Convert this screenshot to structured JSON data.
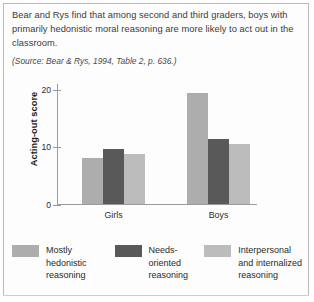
{
  "caption": {
    "text": "Bear and Rys find that among second and third graders, boys with primarily hedonistic moral reasoning are more likely to act out in the classroom.",
    "source": "(Source: Bear & Rys, 1994, Table 2, p. 636.)"
  },
  "chart_data": {
    "type": "bar",
    "title": "",
    "xlabel": "",
    "ylabel": "Acting-out score",
    "categories": [
      "Girls",
      "Boys"
    ],
    "ylim": [
      0,
      21
    ],
    "yticks": [
      0,
      10,
      20
    ],
    "ytick_labels": [
      "0",
      "10",
      "20"
    ],
    "grid": false,
    "legend_position": "below",
    "series": [
      {
        "name": "Mostly hedonistic reasoning",
        "legend_label": "Mostly\nhedonistic\nreasoning",
        "color": "#adadad",
        "values": [
          8.0,
          19.3
        ]
      },
      {
        "name": "Needs-oriented reasoning",
        "legend_label": "Needs-\noriented\nreasoning",
        "color": "#595959",
        "values": [
          9.5,
          11.3
        ]
      },
      {
        "name": "Interpersonal and internalized reasoning",
        "legend_label": "Interpersonal\nand internalized\nreasoning",
        "color": "#bcbcbc",
        "values": [
          8.7,
          10.5
        ]
      }
    ]
  }
}
